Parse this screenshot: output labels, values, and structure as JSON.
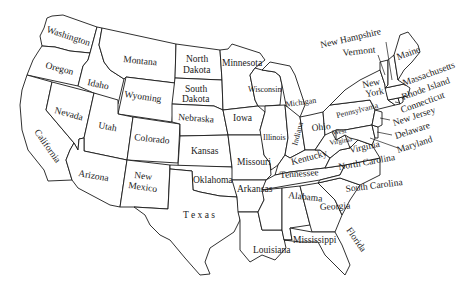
{
  "map": {
    "title": "",
    "fill_color": "#ffffff",
    "stroke_color": "#1a1a1a",
    "states": [
      {
        "name": "Washington"
      },
      {
        "name": "Oregon"
      },
      {
        "name": "California"
      },
      {
        "name": "Idaho"
      },
      {
        "name": "Nevada"
      },
      {
        "name": "Montana"
      },
      {
        "name": "Wyoming"
      },
      {
        "name": "Utah"
      },
      {
        "name": "Arizona"
      },
      {
        "name": "Colorado"
      },
      {
        "name": "New Mexico"
      },
      {
        "name": "North Dakota"
      },
      {
        "name": "South Dakota"
      },
      {
        "name": "Nebraska"
      },
      {
        "name": "Kansas"
      },
      {
        "name": "Oklahoma"
      },
      {
        "name": "Texas"
      },
      {
        "name": "Minnesota"
      },
      {
        "name": "Iowa"
      },
      {
        "name": "Missouri"
      },
      {
        "name": "Arkansas"
      },
      {
        "name": "Louisiana"
      },
      {
        "name": "Wisconsin"
      },
      {
        "name": "Illinois"
      },
      {
        "name": "Michigan"
      },
      {
        "name": "Indiana"
      },
      {
        "name": "Ohio"
      },
      {
        "name": "Kentucky"
      },
      {
        "name": "Tennessee"
      },
      {
        "name": "Mississippi"
      },
      {
        "name": "Alabama"
      },
      {
        "name": "Georgia"
      },
      {
        "name": "Florida"
      },
      {
        "name": "South Carolina"
      },
      {
        "name": "North Carolina"
      },
      {
        "name": "Virginia"
      },
      {
        "name": "West Virginia"
      },
      {
        "name": "Pennsylvania"
      },
      {
        "name": "New York"
      },
      {
        "name": "Maryland"
      },
      {
        "name": "Delaware"
      },
      {
        "name": "New Jersey"
      },
      {
        "name": "Connecticut"
      },
      {
        "name": "Rhode Island"
      },
      {
        "name": "Massachusetts"
      },
      {
        "name": "Vermont"
      },
      {
        "name": "New Hampshire"
      },
      {
        "name": "Maine"
      }
    ],
    "labels": {
      "washington": "Washington",
      "oregon": "Oregon",
      "california": "California",
      "idaho": "Idaho",
      "nevada": "Nevada",
      "montana": "Montana",
      "wyoming": "Wyoming",
      "utah": "Utah",
      "arizona": "Arizona",
      "colorado": "Colorado",
      "new_mexico_1": "New",
      "new_mexico_2": "Mexico",
      "north_dakota_1": "North",
      "north_dakota_2": "Dakota",
      "south_dakota_1": "South",
      "south_dakota_2": "Dakota",
      "nebraska": "Nebraska",
      "kansas": "Kansas",
      "oklahoma": "Oklahoma",
      "texas": "T e x a s",
      "minnesota": "Minnesota",
      "iowa": "Iowa",
      "missouri": "Missouri",
      "arkansas": "Arkansas",
      "louisiana": "Louisiana",
      "wisconsin": "Wisconsin",
      "illinois": "Illinois",
      "michigan": "Michigan",
      "indiana": "Indiana",
      "ohio": "Ohio",
      "kentucky": "Kentucky",
      "tennessee": "Tennessee",
      "mississippi": "Mississippi",
      "alabama": "Alabama",
      "georgia": "Georgia",
      "florida": "Florida",
      "south_carolina": "South Carolina",
      "north_carolina": "North Carolina",
      "virginia": "Virginia",
      "west_virginia_1": "West",
      "west_virginia_2": "Virginia",
      "pennsylvania": "Pennsylvania",
      "new_york_1": "New",
      "new_york_2": "York",
      "maryland": "Maryland",
      "delaware": "Delaware",
      "new_jersey": "New Jersey",
      "connecticut": "Connecticut",
      "rhode_island": "Rhode Island",
      "massachusetts": "Massachusetts",
      "vermont": "Vermont",
      "new_hampshire": "New Hampshire",
      "maine": "Maine"
    }
  }
}
